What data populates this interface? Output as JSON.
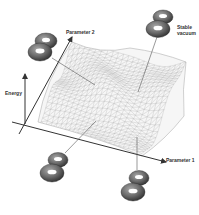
{
  "figure": {
    "axes": {
      "x": {
        "label": "Parameter 1"
      },
      "y": {
        "label": "Parameter 2"
      },
      "z": {
        "label": "Energy"
      }
    },
    "annotations": [
      {
        "id": "stable-vacuum",
        "label": "Stable vacuum"
      }
    ],
    "markers": [
      {
        "id": "torus-pair-top-left",
        "shape": "double-torus"
      },
      {
        "id": "torus-pair-top-right",
        "shape": "double-torus",
        "annotation": "stable-vacuum"
      },
      {
        "id": "torus-pair-bottom-left",
        "shape": "double-torus"
      },
      {
        "id": "torus-pair-bottom-right",
        "shape": "double-torus"
      }
    ],
    "surface": {
      "type": "wireframe-mesh",
      "color": "#b8b8b8"
    },
    "colors": {
      "axis": "#333333",
      "mesh": "#b8b8b8",
      "torus_dark": "#3a3a3a",
      "torus_light": "#9a9a9a",
      "background": "#ffffff"
    }
  }
}
